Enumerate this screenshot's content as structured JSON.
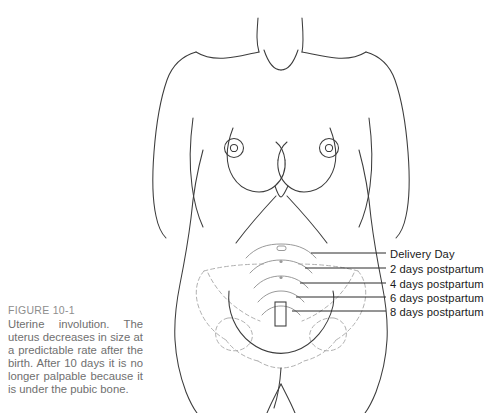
{
  "figure": {
    "caption_heading": "FIGURE 10-1",
    "caption_body": "Uterine involution. The uterus decreases in size at a predictable rate after the birth. After 10 days it is no longer palpable because it is under the pubic bone.",
    "illustration_name": "female-torso-anterior-view",
    "colors": {
      "body_outline": "#3c3c3c",
      "fundal_line": "#9a9a9a",
      "pelvis_dashed": "#b0b0b0",
      "leader_line": "#2b2b2b",
      "label_text": "#1a1a1a",
      "caption_heading_text": "#8d8d8d",
      "caption_body_text": "#6f6f6f",
      "background": "#ffffff"
    }
  },
  "callouts": [
    {
      "label": "Delivery Day",
      "label_x": 390,
      "label_y": 248,
      "line_y": 253,
      "line_x1": 311,
      "line_x2": 386,
      "fundus_y": 250,
      "fundus_half_width": 34
    },
    {
      "label": "2 days postpartum",
      "label_x": 390,
      "label_y": 263,
      "line_y": 268,
      "line_x1": 305,
      "line_x2": 386,
      "fundus_y": 265,
      "fundus_half_width": 31
    },
    {
      "label": "4 days postpartum",
      "label_x": 390,
      "label_y": 278,
      "line_y": 283,
      "line_x1": 300,
      "line_x2": 386,
      "fundus_y": 280,
      "fundus_half_width": 28
    },
    {
      "label": "6 days postpartum",
      "label_x": 390,
      "label_y": 292,
      "line_y": 297,
      "line_x1": 296,
      "line_x2": 386,
      "fundus_y": 294,
      "fundus_half_width": 25
    },
    {
      "label": "8 days postpartum",
      "label_x": 390,
      "label_y": 306,
      "line_y": 311,
      "line_x1": 292,
      "line_x2": 386,
      "fundus_y": 308,
      "fundus_half_width": 22
    }
  ],
  "anatomy_labels": {
    "umbilicus": "umbilicus-marker",
    "left_breast": "left-breast",
    "right_breast": "right-breast",
    "left_nipple": "left-nipple",
    "right_nipple": "right-nipple",
    "costal_margin": "costal-margin",
    "pelvis": "pelvic-bones-dashed",
    "uterus": "uterus-outline",
    "cervix": "cervix-vagina"
  }
}
